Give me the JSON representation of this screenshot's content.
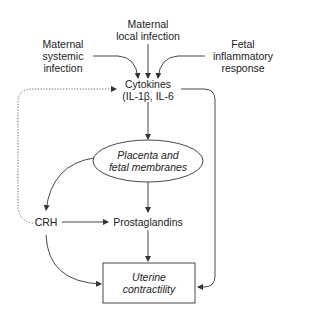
{
  "diagram": {
    "nodes": {
      "maternal_local": {
        "line1": "Maternal",
        "line2": "local infection"
      },
      "maternal_systemic": {
        "line1": "Maternal",
        "line2": "systemic",
        "line3": "infection"
      },
      "fetal_inflammatory": {
        "line1": "Fetal",
        "line2": "inflammatory",
        "line3": "response"
      },
      "cytokines": {
        "line1": "Cytokines",
        "line2": "(IL-1β, IL-6"
      },
      "placenta": {
        "line1": "Placenta and",
        "line2": "fetal membranes"
      },
      "crh": {
        "label": "CRH"
      },
      "prostaglandins": {
        "label": "Prostaglandins"
      },
      "uterine": {
        "line1": "Uterine",
        "line2": "contractility"
      }
    },
    "edges": [
      {
        "from": "Maternal systemic infection",
        "to": "Cytokines",
        "style": "solid"
      },
      {
        "from": "Maternal local infection",
        "to": "Cytokines",
        "style": "solid"
      },
      {
        "from": "Fetal inflammatory response",
        "to": "Cytokines",
        "style": "solid"
      },
      {
        "from": "Cytokines",
        "to": "Placenta and fetal membranes",
        "style": "solid"
      },
      {
        "from": "Cytokines",
        "to": "Uterine contractility",
        "style": "solid"
      },
      {
        "from": "Placenta and fetal membranes",
        "to": "CRH",
        "style": "solid"
      },
      {
        "from": "Placenta and fetal membranes",
        "to": "Prostaglandins",
        "style": "solid"
      },
      {
        "from": "CRH",
        "to": "Prostaglandins",
        "style": "solid"
      },
      {
        "from": "CRH",
        "to": "Uterine contractility",
        "style": "solid"
      },
      {
        "from": "Prostaglandins",
        "to": "Uterine contractility",
        "style": "solid"
      },
      {
        "from": "CRH",
        "to": "Cytokines",
        "style": "dotted"
      }
    ],
    "colors": {
      "line": "#333333",
      "text": "#222222",
      "background": "#ffffff"
    }
  }
}
